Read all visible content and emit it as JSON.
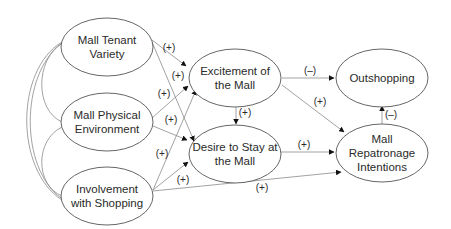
{
  "diagram": {
    "type": "path-model",
    "colors": {
      "node_stroke": "#555555",
      "edge": "#8a8a8a",
      "arrowhead": "#111111",
      "text": "#2a2a2a"
    },
    "nodes": {
      "tenant": {
        "lines": [
          "Mall Tenant",
          "Variety"
        ]
      },
      "physical": {
        "lines": [
          "Mall Physical",
          "Environment"
        ]
      },
      "involvement": {
        "lines": [
          "Involvement",
          "with Shopping"
        ]
      },
      "excitement": {
        "lines": [
          "Excitement of",
          "the Mall"
        ]
      },
      "desire": {
        "lines": [
          "Desire to Stay at",
          "the Mall"
        ]
      },
      "outshopping": {
        "lines": [
          "Outshopping"
        ]
      },
      "repatronage": {
        "lines": [
          "Mall",
          "Repatronage",
          "Intentions"
        ]
      }
    },
    "edges": [
      {
        "from": "tenant",
        "to": "excitement",
        "sign": "(+)"
      },
      {
        "from": "tenant",
        "to": "desire",
        "sign": "(+)"
      },
      {
        "from": "physical",
        "to": "excitement",
        "sign": "(+)"
      },
      {
        "from": "physical",
        "to": "desire",
        "sign": "(+)"
      },
      {
        "from": "involvement",
        "to": "excitement",
        "sign": "(+)"
      },
      {
        "from": "involvement",
        "to": "desire",
        "sign": "(+)"
      },
      {
        "from": "involvement",
        "to": "repatronage",
        "sign": "(+)"
      },
      {
        "from": "excitement",
        "to": "desire",
        "sign": "(+)"
      },
      {
        "from": "excitement",
        "to": "outshopping",
        "sign": "(–)"
      },
      {
        "from": "excitement",
        "to": "repatronage",
        "sign": "(+)"
      },
      {
        "from": "desire",
        "to": "repatronage",
        "sign": "(+)"
      },
      {
        "from": "repatronage",
        "to": "outshopping",
        "sign": "(–)"
      }
    ],
    "correlations": [
      {
        "a": "tenant",
        "b": "physical"
      },
      {
        "a": "physical",
        "b": "involvement"
      },
      {
        "a": "tenant",
        "b": "involvement"
      }
    ]
  }
}
